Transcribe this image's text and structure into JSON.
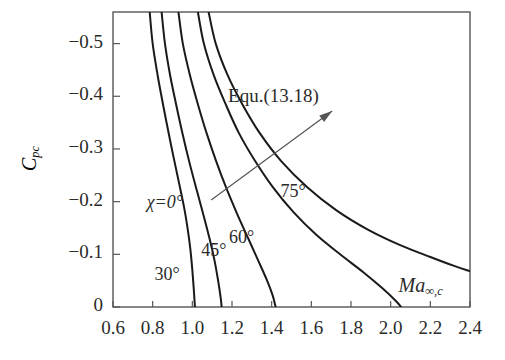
{
  "chart_data": {
    "type": "line",
    "title": "",
    "subtitle": "",
    "xlabel": "Ma",
    "xlabel_sub": "∞,c",
    "ylabel": "C",
    "ylabel_sub": "pc",
    "xlim": [
      0.6,
      2.4
    ],
    "ylim": [
      0.0,
      -0.56
    ],
    "grid": false,
    "legend_position": "inline-curve-labels",
    "xticks": [
      "0.6",
      "0.8",
      "1.0",
      "1.2",
      "1.4",
      "1.6",
      "1.8",
      "2.0",
      "2.2",
      "2.4"
    ],
    "xtick_values": [
      0.6,
      0.8,
      1.0,
      1.2,
      1.4,
      1.6,
      1.8,
      2.0,
      2.2,
      2.4
    ],
    "yticks": [
      "-0.5",
      "-0.4",
      "-0.3",
      "-0.2",
      "-0.1",
      "0"
    ],
    "ytick_values": [
      -0.5,
      -0.4,
      -0.3,
      -0.2,
      -0.1,
      0.0
    ],
    "annotations": [
      {
        "id": "equ",
        "text": "Equ.(13.18)",
        "x": 1.735,
        "y": -0.395
      }
    ],
    "series": [
      {
        "name": "χ=0°",
        "label": "χ=0°",
        "label_x": 0.79,
        "label_y": -0.196,
        "points": [
          [
            0.785,
            -0.56
          ],
          [
            0.8,
            -0.5
          ],
          [
            0.825,
            -0.44
          ],
          [
            0.852,
            -0.385
          ],
          [
            0.878,
            -0.335
          ],
          [
            0.905,
            -0.285
          ],
          [
            0.932,
            -0.237
          ],
          [
            0.958,
            -0.19
          ],
          [
            0.975,
            -0.152
          ],
          [
            0.99,
            -0.11
          ],
          [
            1.0,
            -0.07
          ],
          [
            1.008,
            -0.03
          ],
          [
            1.013,
            0.0
          ]
        ]
      },
      {
        "name": "χ=30°",
        "label": "30°",
        "label_x": 0.83,
        "label_y": -0.058,
        "points": [
          [
            0.845,
            -0.56
          ],
          [
            0.862,
            -0.5
          ],
          [
            0.888,
            -0.44
          ],
          [
            0.918,
            -0.385
          ],
          [
            0.95,
            -0.33
          ],
          [
            0.985,
            -0.275
          ],
          [
            1.022,
            -0.222
          ],
          [
            1.058,
            -0.172
          ],
          [
            1.088,
            -0.128
          ],
          [
            1.112,
            -0.088
          ],
          [
            1.13,
            -0.05
          ],
          [
            1.142,
            -0.02
          ],
          [
            1.148,
            0.0
          ]
        ]
      },
      {
        "name": "χ=45°",
        "label": "45°",
        "label_x": 1.065,
        "label_y": -0.105,
        "points": [
          [
            0.93,
            -0.56
          ],
          [
            0.952,
            -0.5
          ],
          [
            0.988,
            -0.44
          ],
          [
            1.028,
            -0.385
          ],
          [
            1.072,
            -0.33
          ],
          [
            1.12,
            -0.277
          ],
          [
            1.172,
            -0.225
          ],
          [
            1.228,
            -0.175
          ],
          [
            1.282,
            -0.13
          ],
          [
            1.33,
            -0.09
          ],
          [
            1.375,
            -0.052
          ],
          [
            1.405,
            -0.022
          ],
          [
            1.42,
            0.0
          ]
        ]
      },
      {
        "name": "χ=60°",
        "label": "60°",
        "label_x": 1.205,
        "label_y": -0.13,
        "points": [
          [
            1.028,
            -0.56
          ],
          [
            1.058,
            -0.5
          ],
          [
            1.108,
            -0.44
          ],
          [
            1.168,
            -0.385
          ],
          [
            1.235,
            -0.33
          ],
          [
            1.315,
            -0.278
          ],
          [
            1.405,
            -0.228
          ],
          [
            1.51,
            -0.18
          ],
          [
            1.625,
            -0.137
          ],
          [
            1.745,
            -0.1
          ],
          [
            1.862,
            -0.066
          ],
          [
            1.96,
            -0.035
          ],
          [
            2.03,
            -0.01
          ],
          [
            2.052,
            0.0
          ]
        ]
      },
      {
        "name": "χ=75°",
        "label": "75°",
        "label_x": 1.465,
        "label_y": -0.217,
        "points": [
          [
            1.082,
            -0.56
          ],
          [
            1.118,
            -0.5
          ],
          [
            1.178,
            -0.44
          ],
          [
            1.252,
            -0.385
          ],
          [
            1.34,
            -0.33
          ],
          [
            1.448,
            -0.277
          ],
          [
            1.578,
            -0.228
          ],
          [
            1.725,
            -0.184
          ],
          [
            1.885,
            -0.147
          ],
          [
            2.045,
            -0.118
          ],
          [
            2.2,
            -0.095
          ],
          [
            2.32,
            -0.078
          ],
          [
            2.4,
            -0.068
          ]
        ]
      }
    ]
  },
  "style": {
    "axis_color": "#555555",
    "curve_color": "#1a1a1a",
    "text_color": "#2b2b2b",
    "background": "#ffffff"
  }
}
